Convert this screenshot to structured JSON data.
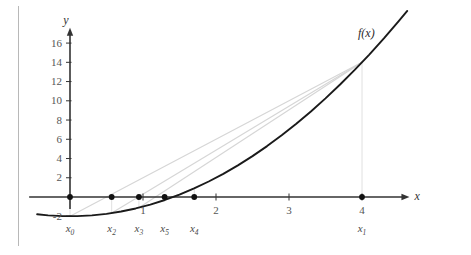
{
  "figure": {
    "name": "secant-method-convergence-plot",
    "background_color": "#ffffff",
    "axis_color": "#333333",
    "curve_color": "#1a1a1a",
    "secant_color": "#d6d6d6",
    "dropline_color": "#e0e0e0",
    "marker_color": "#111111",
    "rule_color": "#b8b8b8"
  },
  "axes": {
    "x_label": "x",
    "y_label": "y",
    "x_ticks": [
      "1",
      "2",
      "3",
      "4"
    ],
    "x_tick_values": [
      1,
      2,
      3,
      4
    ],
    "y_ticks": [
      "16",
      "14",
      "12",
      "10",
      "8",
      "6",
      "4",
      "2",
      "-2"
    ],
    "y_tick_values": [
      16,
      14,
      12,
      10,
      8,
      6,
      4,
      2,
      -2
    ],
    "xlim": [
      -0.45,
      4.65
    ],
    "ylim": [
      -2.6,
      17.6
    ],
    "grid": false
  },
  "curve": {
    "label": "f(x)",
    "expression_values_x": [
      -0.45,
      -0.3,
      -0.1,
      0.1,
      0.3,
      0.5,
      0.7,
      0.9,
      1.1,
      1.3,
      1.5,
      1.7,
      1.9,
      2.1,
      2.3,
      2.5,
      2.7,
      2.9,
      3.1,
      3.3,
      3.5,
      3.7,
      3.9,
      4.1,
      4.3,
      4.5,
      4.62
    ],
    "expression_values_y": [
      -1.7975,
      -1.91,
      -1.99,
      -1.99,
      -1.91,
      -1.75,
      -1.51,
      -1.19,
      -0.79,
      -0.31,
      0.25,
      0.89,
      1.61,
      2.41,
      3.29,
      4.25,
      5.29,
      6.41,
      7.61,
      8.89,
      10.25,
      11.69,
      13.21,
      14.81,
      16.49,
      18.25,
      19.3444
    ]
  },
  "iterates": [
    {
      "label": "x",
      "sub": "0",
      "x": 0.0,
      "y": 0.0,
      "has_marker": true
    },
    {
      "label": "x",
      "sub": "2",
      "x": 0.571,
      "y": 0.0,
      "has_marker": true
    },
    {
      "label": "x",
      "sub": "3",
      "x": 0.944,
      "y": 0.0,
      "has_marker": true
    },
    {
      "label": "x",
      "sub": "5",
      "x": 1.296,
      "y": 0.0,
      "has_marker": true
    },
    {
      "label": "x",
      "sub": "4",
      "x": 1.702,
      "y": 0.0,
      "has_marker": true
    },
    {
      "label": "x",
      "sub": "1",
      "x": 4.0,
      "y": 0.0,
      "has_marker": true
    }
  ],
  "secant_lines": [
    {
      "name": "secant-x0-x1",
      "x1": 0.0,
      "y1": -2.0,
      "x2": 4.0,
      "y2": 14.0
    },
    {
      "name": "secant-x2-x1",
      "x1": 0.571,
      "y1": -1.674,
      "x2": 4.0,
      "y2": 14.0
    },
    {
      "name": "secant-x3-x1",
      "x1": 0.944,
      "y1": -1.109,
      "x2": 4.0,
      "y2": 14.0
    },
    {
      "name": "secant-x5-x4",
      "x1": 1.296,
      "y1": -0.32,
      "x2": 1.702,
      "y2": 0.897
    }
  ],
  "droplines": [
    {
      "name": "dropline-x1",
      "x": 4.0,
      "y_top": 14.0,
      "y_bottom": 0.0
    },
    {
      "name": "dropline-x0",
      "x": 0.0,
      "y_top": 0.0,
      "y_bottom": -2.0
    },
    {
      "name": "dropline-x2",
      "x": 0.571,
      "y_top": 0.0,
      "y_bottom": -1.674
    },
    {
      "name": "dropline-x3",
      "x": 0.944,
      "y_top": 0.0,
      "y_bottom": -1.109
    },
    {
      "name": "dropline-x4",
      "x": 1.702,
      "y_top": 0.897,
      "y_bottom": 0.0
    }
  ]
}
